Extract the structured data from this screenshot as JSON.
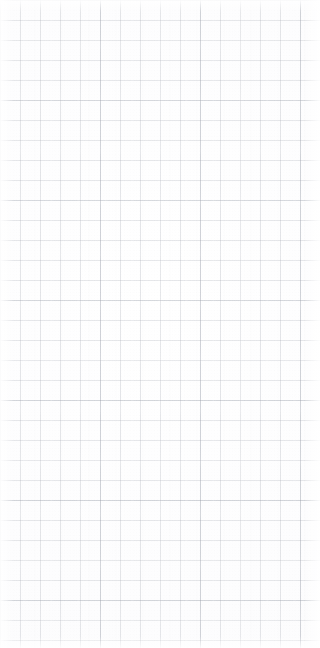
{
  "page": {
    "kind": "grid-paper-sheet",
    "width_px": 320,
    "height_px": 648,
    "has_text": false,
    "has_icons": false,
    "has_controls": false
  },
  "grid": {
    "minor_cell_px": 20,
    "major_cell_px": 100,
    "columns": 16,
    "rows": 32,
    "line_width_px": 1,
    "origin_x_px": 0,
    "origin_y_px": 0
  },
  "colors": {
    "paper": "#ffffff",
    "paper_tint": "#fdfdfe",
    "minor_line": "#a8acb6",
    "major_line": "#969ba8",
    "edge_highlight": "#ffffff"
  },
  "texture": {
    "vertical_band_period_px": 27,
    "horizontal_streak_period_px": 52,
    "grain_scale_px": 3,
    "edge_glow_px": 16
  }
}
